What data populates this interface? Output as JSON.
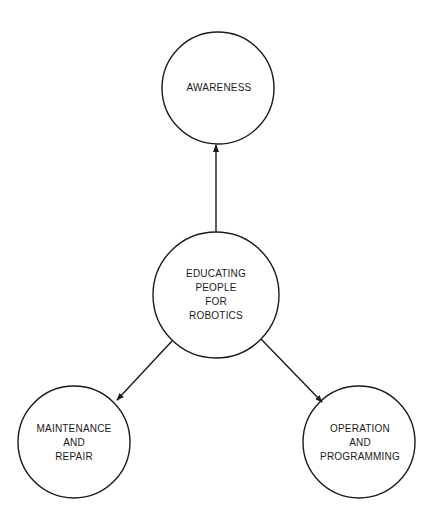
{
  "diagram": {
    "type": "hub-and-spoke",
    "colors": {
      "stroke": "#1a1a1a",
      "background": "#ffffff",
      "text": "#1a1a1a"
    },
    "center": {
      "id": "center",
      "lines": [
        "EDUCATING",
        "PEOPLE",
        "FOR",
        "ROBOTICS"
      ],
      "cx": 216,
      "cy": 295,
      "r": 63
    },
    "nodes": [
      {
        "id": "awareness",
        "lines": [
          "AWARENESS"
        ],
        "cx": 218,
        "cy": 88,
        "r": 56
      },
      {
        "id": "maintenance",
        "lines": [
          "MAINTENANCE",
          "AND",
          "REPAIR"
        ],
        "cx": 74,
        "cy": 442,
        "r": 56
      },
      {
        "id": "operation",
        "lines": [
          "OPERATION",
          "AND",
          "PROGRAMMING"
        ],
        "cx": 359,
        "cy": 442,
        "r": 56
      }
    ],
    "edges": [
      {
        "from": "center",
        "to": "awareness",
        "arrow": "end"
      },
      {
        "from": "center",
        "to": "maintenance",
        "arrow": "end"
      },
      {
        "from": "center",
        "to": "operation",
        "arrow": "end"
      }
    ]
  }
}
